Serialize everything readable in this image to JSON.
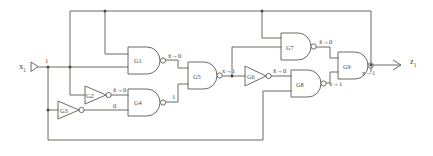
{
  "diagram": {
    "line_color": "#5a5a52",
    "background": "#ffffff",
    "gates": [
      {
        "id": "G1",
        "label": "G1",
        "type": "nand",
        "output_signal": "x̄→0"
      },
      {
        "id": "G2",
        "label": "G2",
        "type": "inverter",
        "output_signal": "x̄→0"
      },
      {
        "id": "G3",
        "label": "G3",
        "type": "inverter",
        "output_signal": "0"
      },
      {
        "id": "G4",
        "label": "G4",
        "type": "nand",
        "output_signal": "1"
      },
      {
        "id": "G5",
        "label": "G5",
        "type": "nand",
        "output_signal": "x→1"
      },
      {
        "id": "G6",
        "label": "G6",
        "type": "inverter",
        "output_signal": "x̄→0"
      },
      {
        "id": "G7",
        "label": "G7",
        "type": "nand",
        "output_signal": "x̄→0"
      },
      {
        "id": "G8",
        "label": "G8",
        "type": "nand",
        "output_signal": "x→1"
      },
      {
        "id": "G9",
        "label": "G9",
        "type": "nand",
        "output_signal": "x→1"
      }
    ],
    "ports": {
      "input_base": "x",
      "input_sub": "1",
      "input_signal": "1",
      "output_base": "z",
      "output_sub": "1"
    },
    "signal_labels": {
      "g1_out": "x̄→0",
      "g2_out": "x̄→0",
      "g3_out": "0",
      "g4_out": "1",
      "g5_out": "x→1",
      "g6_out": "x̄→0",
      "g7_out": "x̄→0",
      "g8_out": "x→1",
      "g9_out": "x→1",
      "input_node": "1"
    }
  }
}
